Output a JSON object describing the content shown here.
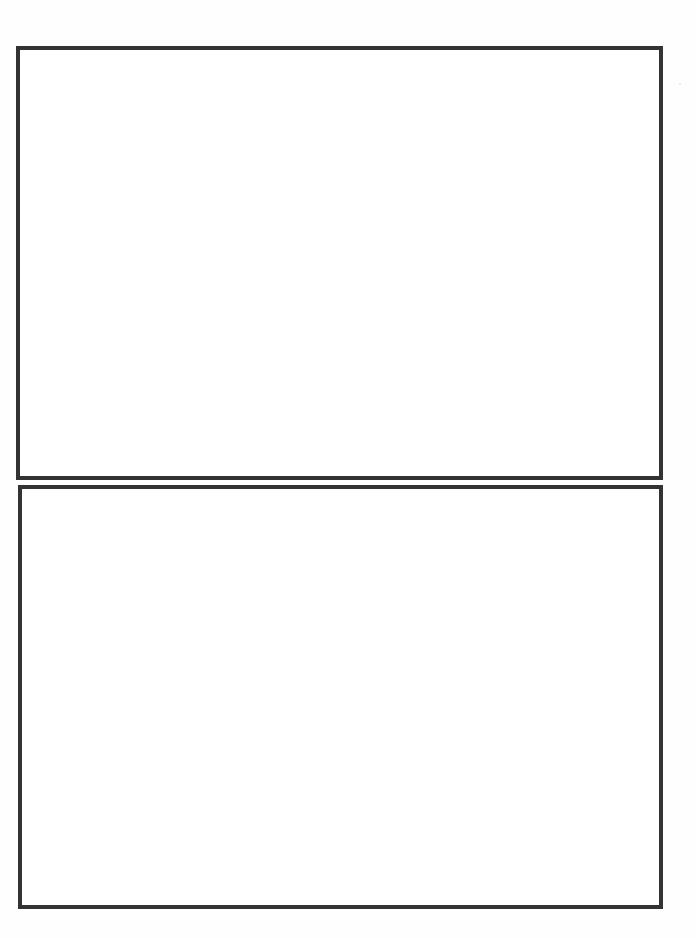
{
  "document": {
    "type": "blank page with two empty bordered frames",
    "background_color": "#ffffff",
    "border_color": "#333333",
    "frames": [
      {
        "position": "top",
        "content": ""
      },
      {
        "position": "bottom",
        "content": ""
      }
    ]
  }
}
